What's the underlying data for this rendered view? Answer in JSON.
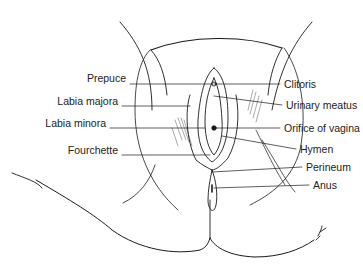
{
  "diagram": {
    "line_color": "#1a1a1a",
    "text_color": "#222222",
    "labels_left": [
      {
        "id": "prepuce",
        "text": "Prepuce",
        "x_right": 126,
        "y": 78
      },
      {
        "id": "labia-majora",
        "text": "Labia majora",
        "x_right": 118,
        "y": 101
      },
      {
        "id": "labia-minora",
        "text": "Labia minora",
        "x_right": 106,
        "y": 123
      },
      {
        "id": "fourchette",
        "text": "Fourchette",
        "x_right": 118,
        "y": 150
      }
    ],
    "labels_right": [
      {
        "id": "clitoris",
        "text": "Clitoris",
        "x_left": 284,
        "y": 84
      },
      {
        "id": "urinary-meatus",
        "text": "Urinary meatus",
        "x_left": 286,
        "y": 105
      },
      {
        "id": "orifice-of-vagina",
        "text": "Orifice of vagina",
        "x_left": 284,
        "y": 128
      },
      {
        "id": "hymen",
        "text": "Hymen",
        "x_left": 300,
        "y": 149
      },
      {
        "id": "perineum",
        "text": "Perineum",
        "x_left": 306,
        "y": 167
      },
      {
        "id": "anus",
        "text": "Anus",
        "x_left": 313,
        "y": 185
      }
    ],
    "signature": "artist-signature"
  }
}
